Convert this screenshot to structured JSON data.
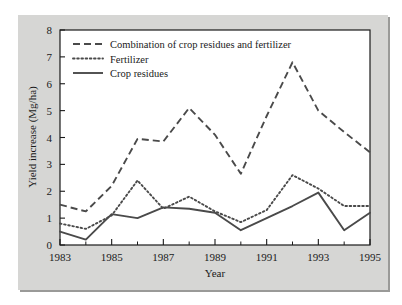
{
  "figure": {
    "panel_background": "#d6d6d4",
    "plot_background": "#ffffff",
    "line_color": "#4a4a4a",
    "axis_color": "#1a1a1a"
  },
  "chart_data": {
    "type": "line",
    "title": "",
    "xlabel": "Year",
    "ylabel": "Yield increase (Mg/ha)",
    "x": [
      1983,
      1984,
      1985,
      1986,
      1987,
      1988,
      1989,
      1990,
      1991,
      1992,
      1993,
      1994,
      1995
    ],
    "xlim": [
      1983,
      1995
    ],
    "ylim": [
      0,
      8
    ],
    "xticks": [
      1983,
      1985,
      1987,
      1989,
      1991,
      1993,
      1995
    ],
    "xtick_labels": [
      "1983",
      "1985",
      "1987",
      "1989",
      "1991",
      "1993",
      "1995"
    ],
    "xminorticks": [
      1984,
      1986,
      1988,
      1990,
      1992,
      1994
    ],
    "yticks": [
      0,
      1,
      2,
      3,
      4,
      5,
      6,
      7,
      8
    ],
    "ytick_labels": [
      "0",
      "1",
      "2",
      "3",
      "4",
      "5",
      "6",
      "7",
      "8"
    ],
    "grid": false,
    "legend_position": "upper-left",
    "series": [
      {
        "name": "Combination of crop residues and fertilizer",
        "style": "dashed",
        "values": [
          1.5,
          1.25,
          2.2,
          3.95,
          3.85,
          5.1,
          4.1,
          2.65,
          4.8,
          6.8,
          5.0,
          4.2,
          3.45
        ]
      },
      {
        "name": "Fertilizer",
        "style": "dotted",
        "values": [
          0.8,
          0.6,
          1.1,
          2.4,
          1.35,
          1.8,
          1.25,
          0.85,
          1.3,
          2.6,
          2.1,
          1.45,
          1.45
        ]
      },
      {
        "name": "Crop residues",
        "style": "solid",
        "values": [
          0.5,
          0.2,
          1.15,
          1.0,
          1.4,
          1.35,
          1.2,
          0.55,
          1.0,
          1.45,
          1.95,
          0.55,
          1.2
        ]
      }
    ]
  },
  "legend": {
    "items": [
      {
        "label": "Combination of crop residues and fertilizer",
        "style": "dashed"
      },
      {
        "label": "Fertilizer",
        "style": "dotted"
      },
      {
        "label": "Crop residues",
        "style": "solid"
      }
    ]
  }
}
